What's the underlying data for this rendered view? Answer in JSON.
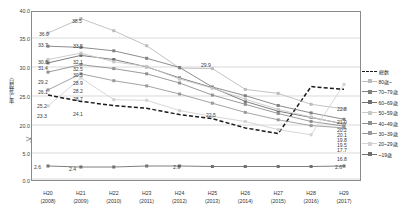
{
  "chart_data": {
    "type": "line",
    "title": "",
    "xlabel": "",
    "ylabel": "自殺死亡率",
    "categories": [
      "H20\n(2008)",
      "H21\n(2009)",
      "H22\n(2010)",
      "H23\n(2011)",
      "H24\n(2012)",
      "H25\n(2013)",
      "H26\n(2014)",
      "H27\n(2015)",
      "H28\n(2016)",
      "H29\n(2017)"
    ],
    "x_labels_era": [
      "H20",
      "H21",
      "H22",
      "H23",
      "H24",
      "H25",
      "H26",
      "H27",
      "H28",
      "H29"
    ],
    "x_labels_year": [
      "(2008)",
      "(2009)",
      "(2010)",
      "(2011)",
      "(2012)",
      "(2013)",
      "(2014)",
      "(2015)",
      "(2016)",
      "(2017)"
    ],
    "yticks": [
      "40.0",
      "35.0",
      "30.0",
      "25.0",
      "20.0",
      "5.0",
      "0.0"
    ],
    "ylim": [
      0,
      40
    ],
    "axis_break": true,
    "grid": true,
    "legend_position": "right",
    "series": [
      {
        "name": "総数",
        "color": "#1a1a1a",
        "style": "dashed",
        "values": [
          25.2,
          24.1,
          23.4,
          22.9,
          21.8,
          21.1,
          19.5,
          18.5,
          17.3,
          16.8
        ]
      },
      {
        "name": "80歳~",
        "color": "#bcbcbc",
        "style": "solid",
        "values": [
          36.0,
          38.5,
          36.4,
          33.8,
          29.9,
          29.8,
          26.2,
          25.5,
          23.6,
          22.8
        ]
      },
      {
        "name": "70~79歳",
        "color": "#808080",
        "style": "solid",
        "values": [
          33.7,
          33.5,
          32.9,
          31.6,
          30.0,
          26.6,
          25.1,
          23.4,
          22.1,
          21.0
        ]
      },
      {
        "name": "60~69歳",
        "color": "#707070",
        "style": "solid",
        "values": [
          30.8,
          32.1,
          31.4,
          30.1,
          28.2,
          26.5,
          24.1,
          22.4,
          21.3,
          20.2
        ]
      },
      {
        "name": "50~59歳",
        "color": "#c8c8c8",
        "style": "solid",
        "values": [
          31.4,
          32.5,
          31.0,
          30.2,
          28.0,
          26.4,
          24.5,
          22.7,
          21.4,
          20.1
        ]
      },
      {
        "name": "40~49歳",
        "color": "#909090",
        "style": "solid",
        "values": [
          29.2,
          30.5,
          29.8,
          28.9,
          27.3,
          25.2,
          23.6,
          22.0,
          20.6,
          19.8
        ]
      },
      {
        "name": "30~39歳",
        "color": "#9a9a9a",
        "style": "solid",
        "values": [
          26.1,
          28.9,
          27.7,
          26.8,
          25.4,
          23.8,
          22.2,
          20.9,
          19.9,
          19.5
        ]
      },
      {
        "name": "20~29歳",
        "color": "#d2d2d2",
        "style": "solid",
        "values": [
          23.3,
          28.2,
          24.4,
          24.3,
          22.5,
          21.5,
          20.6,
          19.2,
          18.3,
          17.7
        ]
      },
      {
        "name": "~19歳",
        "color": "#707070",
        "style": "solid",
        "values": [
          2.6,
          2.4,
          2.4,
          2.6,
          2.6,
          2.5,
          2.5,
          2.5,
          2.5,
          2.6
        ]
      }
    ],
    "point_labels": [
      {
        "text": "36.0",
        "x": 39,
        "y": 32
      },
      {
        "text": "38.5",
        "x": 72,
        "y": 19
      },
      {
        "text": "33.7",
        "x": 38,
        "y": 43
      },
      {
        "text": "33.5",
        "x": 73,
        "y": 44
      },
      {
        "text": "30.8",
        "x": 38,
        "y": 60
      },
      {
        "text": "31.4",
        "x": 38,
        "y": 66
      },
      {
        "text": "32.1",
        "x": 73,
        "y": 60
      },
      {
        "text": "32.5",
        "x": 73,
        "y": 67
      },
      {
        "text": "30.5",
        "x": 73,
        "y": 73
      },
      {
        "text": "29.2",
        "x": 38,
        "y": 80
      },
      {
        "text": "28.9",
        "x": 73,
        "y": 81
      },
      {
        "text": "26.1",
        "x": 38,
        "y": 90
      },
      {
        "text": "28.2",
        "x": 73,
        "y": 89
      },
      {
        "text": "25.2",
        "x": 37,
        "y": 104
      },
      {
        "text": "28.7",
        "x": 73,
        "y": 97
      },
      {
        "text": "23.3",
        "x": 37,
        "y": 114
      },
      {
        "text": "24.1",
        "x": 73,
        "y": 112
      },
      {
        "text": "29.9",
        "x": 201,
        "y": 63
      },
      {
        "text": "22.5",
        "x": 206,
        "y": 113
      },
      {
        "text": "22.8",
        "x": 337,
        "y": 107
      },
      {
        "text": "21.0",
        "x": 337,
        "y": 120
      },
      {
        "text": "20.2",
        "x": 337,
        "y": 128
      },
      {
        "text": "20.1",
        "x": 337,
        "y": 133
      },
      {
        "text": "19.8",
        "x": 337,
        "y": 138
      },
      {
        "text": "19.5",
        "x": 337,
        "y": 143
      },
      {
        "text": "17.7",
        "x": 337,
        "y": 148
      },
      {
        "text": "16.8",
        "x": 337,
        "y": 157
      },
      {
        "text": "2.6",
        "x": 34,
        "y": 165
      },
      {
        "text": "2.4",
        "x": 69,
        "y": 167
      },
      {
        "text": "2.6",
        "x": 173,
        "y": 165
      },
      {
        "text": "2.6",
        "x": 335,
        "y": 165
      }
    ]
  }
}
